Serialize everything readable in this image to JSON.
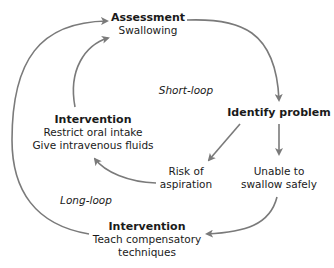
{
  "diagram": {
    "colors": {
      "arrow": "#7a7a7a",
      "text": "#1a1a1a",
      "background": "#ffffff"
    },
    "nodes": {
      "assessment": {
        "title": "Assessment",
        "lines": [
          "Swallowing"
        ]
      },
      "identify": {
        "title": "Identify problem",
        "lines": []
      },
      "risk": {
        "title": "",
        "lines": [
          "Risk of",
          "aspiration"
        ]
      },
      "unable": {
        "title": "",
        "lines": [
          "Unable to",
          "swallow safely"
        ]
      },
      "intervention_short": {
        "title": "Intervention",
        "lines": [
          "Restrict oral intake",
          "Give intravenous fluids"
        ]
      },
      "intervention_long": {
        "title": "Intervention",
        "lines": [
          "Teach compensatory",
          "techniques"
        ]
      }
    },
    "loop_labels": {
      "short": "Short-loop",
      "long": "Long-loop"
    },
    "edges": [
      {
        "from": "assessment",
        "to": "identify"
      },
      {
        "from": "identify",
        "to": "risk"
      },
      {
        "from": "identify",
        "to": "unable"
      },
      {
        "from": "risk",
        "to": "intervention_short"
      },
      {
        "from": "intervention_short",
        "to": "assessment"
      },
      {
        "from": "unable",
        "to": "intervention_long"
      },
      {
        "from": "intervention_long",
        "to": "assessment"
      }
    ]
  }
}
